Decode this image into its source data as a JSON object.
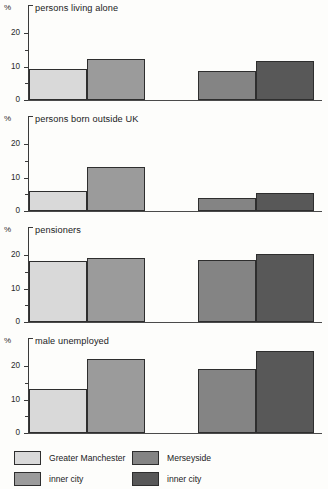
{
  "chart_data": {
    "type": "bar",
    "title": "",
    "ylabel": "%",
    "xlabel": "",
    "ylim": [
      0,
      24.5
    ],
    "grid": false,
    "legend_position": "bottom",
    "tick_labels": [
      "0",
      "10",
      "20"
    ],
    "tick_values": [
      0,
      10,
      20
    ],
    "minor_tick_values": [
      5,
      15
    ],
    "categories": [
      "Greater Manchester",
      "Greater Manchester inner city",
      "Merseyside",
      "Merseyside inner city"
    ],
    "series": [
      {
        "name": "persons living alone",
        "values": [
          9.3,
          12.3,
          8.7,
          11.8
        ]
      },
      {
        "name": "persons born outside UK",
        "values": [
          6.0,
          13.0,
          3.8,
          5.5
        ]
      },
      {
        "name": "pensioners",
        "values": [
          18.2,
          19.0,
          18.6,
          20.3
        ]
      },
      {
        "name": "male unemployed",
        "values": [
          13.0,
          22.0,
          19.2,
          24.5
        ]
      }
    ],
    "colors": {
      "greater_manchester": "#d9d9d9",
      "greater_manchester_inner_city": "#9b9b9b",
      "merseyside": "#848484",
      "merseyside_inner_city": "#585858",
      "axis": "#3a3a3a",
      "bar_outline": "#2e2e2e"
    }
  },
  "panels": [
    {
      "axis_unit": "%",
      "title": "persons living alone"
    },
    {
      "axis_unit": "%",
      "title": "persons born outside UK"
    },
    {
      "axis_unit": "%",
      "title": "pensioners"
    },
    {
      "axis_unit": "%",
      "title": "male unemployed"
    }
  ],
  "legend": {
    "items": [
      {
        "label": "Greater Manchester",
        "color": "#d9d9d9"
      },
      {
        "label": "Merseyside",
        "color": "#848484"
      },
      {
        "label": "inner city",
        "color": "#9b9b9b"
      },
      {
        "label": "inner city",
        "color": "#585858"
      }
    ]
  }
}
